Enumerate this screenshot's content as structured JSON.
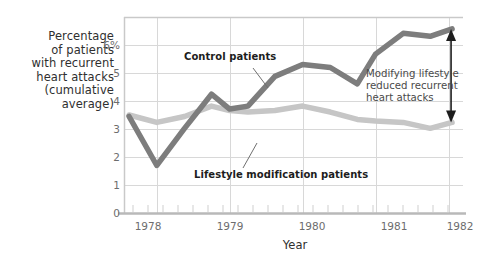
{
  "chart_data": {
    "type": "line",
    "title": "",
    "xlabel": "Year",
    "ylabel": "Percentage of patients with recurrent heart attacks (cumulative average)",
    "ylabel_lines": [
      "Percentage",
      "of patients",
      "with recurrent",
      "heart attacks",
      "(cumulative",
      "average)"
    ],
    "ylim": [
      0,
      6.6
    ],
    "xlim": [
      1977.55,
      1982.2
    ],
    "grid": true,
    "legend_position": "inline-annotations",
    "y_ticks": [
      0,
      1,
      2,
      3,
      4,
      5,
      6
    ],
    "y_tick_labels": [
      "0",
      "1",
      "2",
      "3",
      "4",
      "5",
      "6%"
    ],
    "x_ticks": [
      1978,
      1979,
      1980,
      1981,
      1982
    ],
    "x_tick_labels": [
      "1978",
      "1979",
      "1980",
      "1981",
      "1982"
    ],
    "x_minor_tick_count_per_year": 4,
    "series": [
      {
        "name": "Control patients",
        "color": "#7d7d7d",
        "x": [
          1977.62,
          1978.0,
          1978.38,
          1978.75,
          1979.0,
          1979.25,
          1979.62,
          1980.0,
          1980.38,
          1980.75,
          1981.0,
          1981.38,
          1981.75,
          1982.05
        ],
        "values": [
          3.25,
          1.6,
          2.85,
          4.0,
          3.5,
          3.6,
          4.6,
          5.0,
          4.9,
          4.35,
          5.35,
          6.05,
          5.95,
          6.2
        ]
      },
      {
        "name": "Lifestyle modification patients",
        "color": "#c6c6c6",
        "x": [
          1977.62,
          1978.0,
          1978.38,
          1978.75,
          1979.0,
          1979.25,
          1979.62,
          1980.0,
          1980.38,
          1980.75,
          1981.0,
          1981.38,
          1981.75,
          1982.05
        ],
        "values": [
          3.3,
          3.05,
          3.25,
          3.6,
          3.45,
          3.4,
          3.45,
          3.6,
          3.4,
          3.15,
          3.1,
          3.05,
          2.85,
          3.05
        ]
      }
    ],
    "annotations": [
      {
        "id": "control-label",
        "text": "Control patients",
        "points_to_series": "Control patients"
      },
      {
        "id": "lifestyle-label",
        "text": "Lifestyle modification patients",
        "points_to_series": "Lifestyle modification patients"
      },
      {
        "id": "gap-callout",
        "lines": [
          "Modifying lifestyle",
          "reduced recurrent",
          "heart attacks"
        ],
        "arrow": "double-headed-vertical",
        "arrow_at_x": 1982.05,
        "arrow_from_value": 6.2,
        "arrow_to_value": 3.05
      }
    ]
  },
  "axis": {
    "x_title": "Year"
  }
}
